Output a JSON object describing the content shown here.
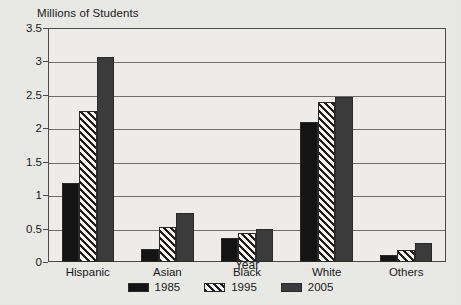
{
  "chart_data": {
    "type": "bar",
    "title": "",
    "ylabel": "Millions of Students",
    "xlabel": "Year",
    "ylim": [
      0,
      3.5
    ],
    "yticks": [
      "0",
      "0.5",
      "1",
      "1.5",
      "2",
      "2.5",
      "3",
      "3.5"
    ],
    "ytick_values": [
      0,
      0.5,
      1,
      1.5,
      2,
      2.5,
      3,
      3.5
    ],
    "grid": "horizontal",
    "legend_position": "bottom-center",
    "categories": [
      "Hispanic",
      "Asian",
      "Black",
      "White",
      "Others"
    ],
    "series": [
      {
        "name": "1985",
        "color": "#141414",
        "fill": "solid",
        "values": [
          1.18,
          0.2,
          0.36,
          2.1,
          0.11
        ]
      },
      {
        "name": "1995",
        "color": "#1d1d1d",
        "fill": "diagonal-hatch",
        "values": [
          2.26,
          0.52,
          0.44,
          2.39,
          0.18
        ]
      },
      {
        "name": "2005",
        "color": "#3b3b3b",
        "fill": "solid",
        "values": [
          3.07,
          0.73,
          0.49,
          2.47,
          0.29
        ]
      }
    ]
  },
  "legend": {
    "entries": [
      {
        "label": "1985",
        "swatch": "solid-black-swatch"
      },
      {
        "label": "1995",
        "swatch": "hatched-swatch"
      },
      {
        "label": "2005",
        "swatch": "solid-gray-swatch"
      }
    ]
  }
}
